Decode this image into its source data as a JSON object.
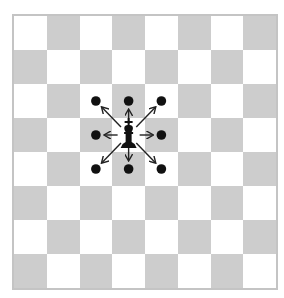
{
  "diagram": {
    "board": {
      "rows": 8,
      "cols": 8,
      "top_left_square": "light",
      "light_color": "#ffffff",
      "dark_color": "#cdcdcd",
      "border_color": "#c4c4c4"
    },
    "piece": {
      "type": "king",
      "color": "black",
      "row": 3,
      "col": 3,
      "glyph": "♚"
    },
    "moves": [
      {
        "row": 2,
        "col": 2,
        "direction": "up-left"
      },
      {
        "row": 2,
        "col": 3,
        "direction": "up"
      },
      {
        "row": 2,
        "col": 4,
        "direction": "up-right"
      },
      {
        "row": 3,
        "col": 2,
        "direction": "left"
      },
      {
        "row": 3,
        "col": 4,
        "direction": "right"
      },
      {
        "row": 4,
        "col": 2,
        "direction": "down-left"
      },
      {
        "row": 4,
        "col": 3,
        "direction": "down"
      },
      {
        "row": 4,
        "col": 4,
        "direction": "down-right"
      }
    ],
    "marker_color": "#111111",
    "arrow_color": "#222222"
  }
}
